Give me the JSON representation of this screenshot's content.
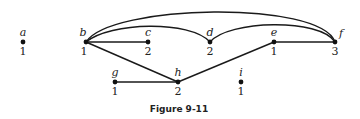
{
  "figure": {
    "caption": "Figure 9-11"
  },
  "graph": {
    "vertices": [
      {
        "id": "a",
        "label": "a",
        "degree": "1",
        "x": 23,
        "y": 42
      },
      {
        "id": "b",
        "label": "b",
        "degree": "1",
        "x": 86,
        "y": 42
      },
      {
        "id": "c",
        "label": "c",
        "degree": "2",
        "x": 148,
        "y": 42
      },
      {
        "id": "d",
        "label": "d",
        "degree": "2",
        "x": 210,
        "y": 42
      },
      {
        "id": "e",
        "label": "e",
        "degree": "1",
        "x": 274,
        "y": 42
      },
      {
        "id": "f",
        "label": "f",
        "degree": "3",
        "x": 335,
        "y": 42
      },
      {
        "id": "g",
        "label": "g",
        "degree": "1",
        "x": 115,
        "y": 82
      },
      {
        "id": "h",
        "label": "h",
        "degree": "2",
        "x": 178,
        "y": 82
      },
      {
        "id": "i",
        "label": "i",
        "degree": "1",
        "x": 241,
        "y": 82
      }
    ],
    "edges": [
      {
        "from": "b",
        "to": "c",
        "shape": "straight"
      },
      {
        "from": "b",
        "to": "h",
        "shape": "straight"
      },
      {
        "from": "g",
        "to": "h",
        "shape": "straight"
      },
      {
        "from": "h",
        "to": "e",
        "shape": "straight"
      },
      {
        "from": "e",
        "to": "f",
        "shape": "straight"
      },
      {
        "from": "b",
        "to": "d",
        "shape": "arc"
      },
      {
        "from": "d",
        "to": "f",
        "shape": "arc"
      },
      {
        "from": "b",
        "to": "f",
        "shape": "arc"
      }
    ]
  }
}
